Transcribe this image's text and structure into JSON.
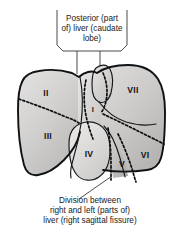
{
  "figure": {
    "background_color": "#ffffff"
  },
  "callouts": {
    "top": {
      "name": "posterior-caudate-callout",
      "lines": [
        "Posterior (part",
        "of) liver (caudate",
        "lobe)"
      ]
    },
    "bottom": {
      "name": "sagittal-fissure-callout",
      "lines": [
        "Division between",
        "right and left (parts of)",
        "liver (right sagittal fissure)"
      ]
    }
  },
  "segments": [
    {
      "id": "II",
      "label": "II",
      "name": "segment-2-label"
    },
    {
      "id": "III",
      "label": "III",
      "name": "segment-3-label"
    },
    {
      "id": "I",
      "label": "I",
      "name": "segment-1-caudate-label"
    },
    {
      "id": "IV",
      "label": "IV",
      "name": "segment-4-label"
    },
    {
      "id": "V",
      "label": "V",
      "name": "segment-5-label"
    },
    {
      "id": "VI",
      "label": "VI",
      "name": "segment-6-label"
    },
    {
      "id": "VII",
      "label": "VII",
      "name": "segment-7-label"
    }
  ],
  "colors": {
    "organ_fill_light": "#dedcda",
    "organ_fill_mid": "#c9c7c5",
    "organ_fill_dark": "#b3b1af",
    "outline": "#101113",
    "text": "#17181a"
  }
}
